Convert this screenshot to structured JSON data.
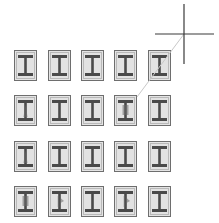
{
  "canvas": {
    "width": 219,
    "height": 223,
    "background": "#ffffff"
  },
  "grid": {
    "rows": 4,
    "columns": 5,
    "tile_icon": "i-beam-icon",
    "tile_border_color": "#6e6e6e",
    "tile_fill_color": "#e4e4e4",
    "beam_color": "#4a4a4a",
    "highlight_color": "#6a6a6a",
    "col_x": [
      14,
      48,
      81,
      114,
      148
    ],
    "row_y": [
      50,
      95,
      141,
      186
    ],
    "tiles": [
      {
        "row": 1,
        "col": 1,
        "variant": "plain"
      },
      {
        "row": 1,
        "col": 2,
        "variant": "plain"
      },
      {
        "row": 1,
        "col": 3,
        "variant": "plain"
      },
      {
        "row": 1,
        "col": 4,
        "variant": "plain"
      },
      {
        "row": 1,
        "col": 5,
        "variant": "plain"
      },
      {
        "row": 2,
        "col": 1,
        "variant": "web-taper"
      },
      {
        "row": 2,
        "col": 2,
        "variant": "plain"
      },
      {
        "row": 2,
        "col": 3,
        "variant": "plain"
      },
      {
        "row": 2,
        "col": 4,
        "variant": "web-block"
      },
      {
        "row": 2,
        "col": 5,
        "variant": "plain"
      },
      {
        "row": 3,
        "col": 1,
        "variant": "web-taper"
      },
      {
        "row": 3,
        "col": 2,
        "variant": "plain"
      },
      {
        "row": 3,
        "col": 3,
        "variant": "plain"
      },
      {
        "row": 3,
        "col": 4,
        "variant": "plain"
      },
      {
        "row": 3,
        "col": 5,
        "variant": "plain"
      },
      {
        "row": 4,
        "col": 1,
        "variant": "web-block"
      },
      {
        "row": 4,
        "col": 2,
        "variant": "web-flag"
      },
      {
        "row": 4,
        "col": 3,
        "variant": "plain"
      },
      {
        "row": 4,
        "col": 4,
        "variant": "web-flag"
      },
      {
        "row": 4,
        "col": 5,
        "variant": "plain"
      }
    ]
  },
  "cursor": {
    "icon": "crosshair-cursor-icon",
    "center_x": 184,
    "center_y": 34,
    "vertical": {
      "x": 184,
      "y1": 4,
      "y2": 64
    },
    "horizontal": {
      "y": 34,
      "x1": 155,
      "x2": 214
    },
    "color": "#3a3a3a"
  },
  "guide_line": {
    "from_x": 184,
    "from_y": 34,
    "to_x": 137,
    "to_y": 97,
    "color": "#c8c8c8"
  }
}
